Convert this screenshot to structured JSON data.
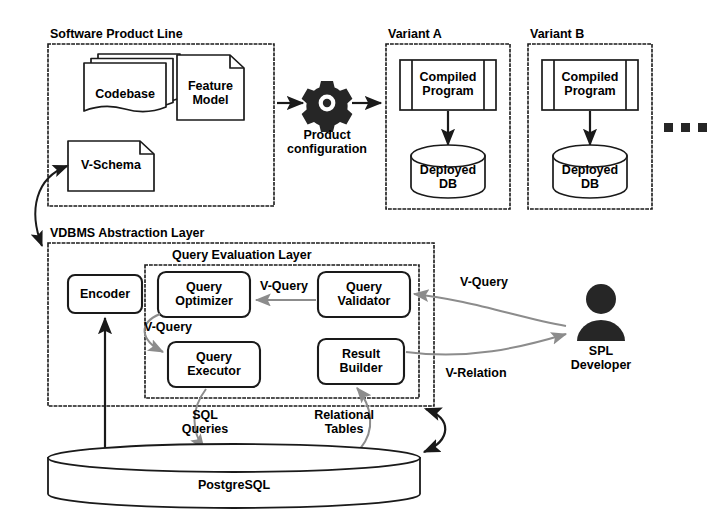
{
  "diagram": {
    "groups": [
      {
        "id": "spl",
        "label": "Software Product Line"
      },
      {
        "id": "varA",
        "label": "Variant A"
      },
      {
        "id": "varB",
        "label": "Variant B"
      },
      {
        "id": "vdbms",
        "label": "VDBMS Abstraction Layer"
      },
      {
        "id": "qel",
        "label": "Query Evaluation Layer"
      }
    ],
    "nodes": [
      {
        "id": "codebase",
        "label": "Codebase",
        "shape": "document-stack"
      },
      {
        "id": "feature-model",
        "label": "Feature\nModel",
        "shape": "document"
      },
      {
        "id": "v-schema",
        "label": "V-Schema",
        "shape": "document"
      },
      {
        "id": "product-config",
        "label": "Product\nconfiguration",
        "shape": "gear-icon"
      },
      {
        "id": "compiled-program-a",
        "label": "Compiled\nProgram",
        "shape": "component"
      },
      {
        "id": "deployed-db-a",
        "label": "Deployed\nDB",
        "shape": "cylinder"
      },
      {
        "id": "compiled-program-b",
        "label": "Compiled\nProgram",
        "shape": "component"
      },
      {
        "id": "deployed-db-b",
        "label": "Deployed\nDB",
        "shape": "cylinder"
      },
      {
        "id": "encoder",
        "label": "Encoder",
        "shape": "rounded-box"
      },
      {
        "id": "query-optimizer",
        "label": "Query\nOptimizer",
        "shape": "rounded-box"
      },
      {
        "id": "query-validator",
        "label": "Query\nValidator",
        "shape": "rounded-box"
      },
      {
        "id": "query-executor",
        "label": "Query\nExecutor",
        "shape": "rounded-box"
      },
      {
        "id": "result-builder",
        "label": "Result\nBuilder",
        "shape": "rounded-box"
      },
      {
        "id": "spl-developer",
        "label": "SPL\nDeveloper",
        "shape": "person-icon"
      },
      {
        "id": "postgresql",
        "label": "PostgreSQL",
        "shape": "cylinder"
      },
      {
        "id": "more-variants",
        "label": "...",
        "shape": "ellipsis-dots"
      }
    ],
    "edge_labels": [
      {
        "id": "v-query-validator-optimizer",
        "label": "V-Query"
      },
      {
        "id": "v-query-optimizer-executor",
        "label": "V-Query"
      },
      {
        "id": "v-query-developer",
        "label": "V-Query"
      },
      {
        "id": "v-relation-developer",
        "label": "V-Relation"
      },
      {
        "id": "sql-queries",
        "label": "SQL\nQueries"
      },
      {
        "id": "relational-tables",
        "label": "Relational\nTables"
      }
    ],
    "colors": {
      "stroke": "#1a1a1a",
      "gray_arrow": "#8c8c8c",
      "fill": "#ffffff",
      "text": "#000000",
      "icon_fill": "#262626"
    }
  }
}
